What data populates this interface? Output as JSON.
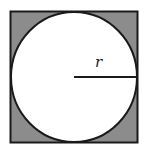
{
  "diagram": {
    "label_radius": "r",
    "colors": {
      "background": "#ffffff",
      "shaded": "#8c8c8c",
      "stroke": "#1a1a1a",
      "circle_fill": "#ffffff"
    },
    "square": {
      "x": 10,
      "y": 11,
      "size": 128
    },
    "circle": {
      "cx": 74,
      "cy": 77,
      "r": 63
    },
    "radius_line": {
      "x1": 74,
      "y1": 77,
      "x2": 137,
      "y2": 77
    }
  }
}
